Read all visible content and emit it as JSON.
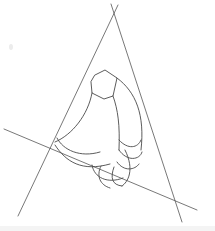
{
  "diagram": {
    "type": "perspective construction sketch",
    "colors": {
      "background": "#ffffff",
      "stroke": "#4a4a4a",
      "construction_stroke": "#555555"
    },
    "construction_lines": [
      {
        "name": "left-line",
        "x1": 18,
        "y1": 216,
        "x2": 118,
        "y2": 5
      },
      {
        "name": "right-line",
        "x1": 111,
        "y1": 4,
        "x2": 182,
        "y2": 222
      },
      {
        "name": "base-line",
        "x1": 4,
        "y1": 129,
        "x2": 197,
        "y2": 210
      }
    ],
    "shapes": {
      "tip_polygon": "95,75 105,70 117,78 113,96 104,99 92,93 91,82",
      "arcs": [
        "M 117,78 C 136,92 145,115 141,150",
        "M 113,96 C 118,110 120,125 119,150",
        "M 92,93 C 88,115 72,135 55,142",
        "M 57,138 C 63,150 80,158 100,152",
        "M 55,145 C 66,162 82,172 110,164",
        "M 119,140 C 128,150 138,148 141,140",
        "M 119,150 C 127,162 140,160 142,152",
        "M 117,162 C 124,172 135,170 139,164",
        "M 114,167 C 110,178 112,185 122,186",
        "M 101,166 C 96,176 100,185 110,188",
        "M 92,165 C 94,178 108,184 123,178",
        "M 125,150 C 135,170 128,182 122,186"
      ]
    }
  }
}
